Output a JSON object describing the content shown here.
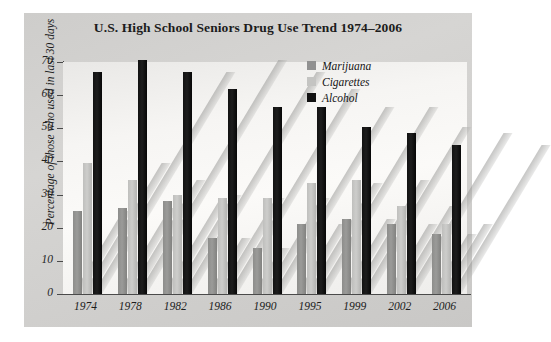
{
  "chart_data": {
    "type": "bar",
    "title": "U.S. High School Seniors Drug Use Trend 1974–2006",
    "xlabel": "",
    "ylabel": "Percentage of those who used in last 30 days",
    "ylim": [
      0,
      70
    ],
    "yticks": [
      0,
      10,
      20,
      30,
      40,
      50,
      60,
      70
    ],
    "grid": false,
    "legend_position": "top-right",
    "categories": [
      "1974",
      "1978",
      "1982",
      "1986",
      "1990",
      "1995",
      "1999",
      "2002",
      "2006"
    ],
    "series": [
      {
        "name": "Marijuana",
        "color": "#919191",
        "values": [
          25,
          26,
          28,
          17,
          14,
          21,
          22.5,
          21,
          18
        ]
      },
      {
        "name": "Cigarettes",
        "color": "#c4c4c2",
        "values": [
          39.5,
          34.5,
          30,
          29,
          29,
          33.5,
          34.5,
          26.5,
          21
        ]
      },
      {
        "name": "Alcohol",
        "color": "#121212",
        "values": [
          67,
          70.5,
          67,
          62,
          56.5,
          56.5,
          50.5,
          48.5,
          45
        ]
      }
    ]
  },
  "colors": {
    "panel": "#d2d2d0",
    "plot_background": "#f7f6f4",
    "axis": "#4a4a4a",
    "text": "#1c1c1c"
  }
}
